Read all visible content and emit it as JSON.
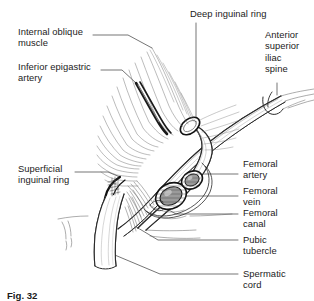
{
  "figure": {
    "caption": "Fig. 32"
  },
  "labels": {
    "internal_oblique_muscle": "Internal oblique\nmuscle",
    "inferior_epigastric_artery": "Inferior epigastric\nartery",
    "superficial_inguinal_ring": "Superficial\ninguinal ring",
    "deep_inguinal_ring": "Deep inguinal ring",
    "anterior_superior_iliac_spine": "Anterior\nsuperior\niliac\nspine",
    "femoral_artery": "Femoral\nartery",
    "femoral_vein": "Femoral\nvein",
    "femoral_canal": "Femoral\ncanal",
    "pubic_tubercle": "Pubic\ntubercle",
    "spermatic_cord": "Spermatic\ncord"
  },
  "colors": {
    "ink": "#1b1b1b",
    "line": "#2a2a2a",
    "hatch": "#555555",
    "fill": "#ffffff",
    "shade": "#8d8d8d",
    "background": "#ffffff"
  }
}
